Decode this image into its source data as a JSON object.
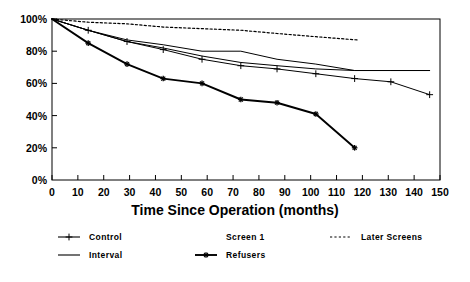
{
  "chart_data": {
    "type": "line",
    "title": "",
    "xlabel": "Time Since Operation (months)",
    "ylabel": "",
    "xlim": [
      0,
      150
    ],
    "ylim": [
      0,
      100
    ],
    "xticks": [
      0,
      10,
      20,
      30,
      40,
      50,
      60,
      70,
      80,
      90,
      100,
      110,
      120,
      130,
      140,
      150
    ],
    "xtick_labels": [
      "0",
      "10",
      "20",
      "30",
      "40",
      "50",
      "60",
      "70",
      "80",
      "90",
      "100",
      "110",
      "120",
      "130",
      "140",
      "150"
    ],
    "yticks": [
      0,
      20,
      40,
      60,
      80,
      100
    ],
    "ytick_labels": [
      "0%",
      "20%",
      "40%",
      "60%",
      "80%",
      "100%"
    ],
    "grid": false,
    "frame": true,
    "legend_position": "below-axes",
    "series": [
      {
        "name": "Control",
        "style": "solid-thin-plus-markers",
        "marker": "plus",
        "color": "#000000",
        "x": [
          0,
          14,
          29,
          43,
          58,
          73,
          87,
          102,
          117,
          131,
          146
        ],
        "y": [
          100,
          93,
          86,
          81,
          75,
          71,
          69,
          66,
          63,
          61,
          53
        ]
      },
      {
        "name": "Interval",
        "style": "solid-thin-no-markers",
        "marker": "none",
        "color": "#000000",
        "x": [
          0,
          14,
          29,
          43,
          58,
          73,
          87,
          102,
          117,
          131,
          146
        ],
        "y": [
          100,
          93,
          86,
          82,
          77,
          73,
          71,
          69,
          68,
          68,
          68
        ]
      },
      {
        "name": "Screen 1",
        "style": "solid-thin-no-markers",
        "marker": "none",
        "color": "#000000",
        "x": [
          0,
          14,
          29,
          43,
          58,
          73,
          87,
          102,
          117,
          131,
          146
        ],
        "y": [
          100,
          93,
          87,
          84,
          80,
          80,
          75,
          72,
          68,
          68,
          68
        ]
      },
      {
        "name": "Refusers",
        "style": "solid-thick-star-markers",
        "marker": "star",
        "color": "#000000",
        "x": [
          0,
          14,
          29,
          43,
          58,
          73,
          87,
          102,
          117
        ],
        "y": [
          100,
          85,
          72,
          63,
          60,
          50,
          48,
          41,
          20
        ]
      },
      {
        "name": "Later Screens",
        "style": "dotted",
        "marker": "none",
        "color": "#000000",
        "x": [
          0,
          14,
          29,
          43,
          58,
          73,
          87,
          102,
          118
        ],
        "y": [
          100,
          98,
          97,
          95,
          94,
          93,
          91,
          89,
          87
        ]
      }
    ]
  },
  "legend": {
    "entries": [
      {
        "label": "Control",
        "sample": "line-plus"
      },
      {
        "label": "Screen 1",
        "sample": "none"
      },
      {
        "label": "Later Screens",
        "sample": "dotted"
      },
      {
        "label": "Interval",
        "sample": "line"
      },
      {
        "label": "Refusers",
        "sample": "line-star"
      }
    ]
  }
}
